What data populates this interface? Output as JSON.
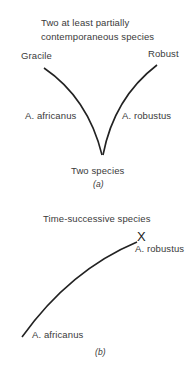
{
  "panel_a": {
    "title_line1": "Two at least partially",
    "title_line2": "contemporaneous species",
    "left_top_label": "Gracile",
    "right_top_label": "Robust",
    "left_branch_label": "A. africanus",
    "right_branch_label": "A. robustus",
    "bottom_label": "Two species",
    "caption": "(a)"
  },
  "panel_b": {
    "title": "Time-successive species",
    "end_label": "A. robustus",
    "end_marker": "X",
    "start_label": "A. africanus",
    "caption": "(b)"
  },
  "colors": {
    "line": "#222222",
    "text": "#3a3a3a"
  }
}
